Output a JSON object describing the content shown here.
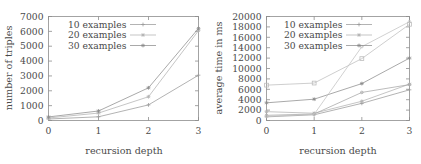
{
  "figure": {
    "panels": [
      "left",
      "right"
    ]
  },
  "left": {
    "ylabel": "number of triples",
    "xlabel": "recursion depth",
    "yticks": [
      "0",
      "1000",
      "2000",
      "3000",
      "4000",
      "5000",
      "6000",
      "7000"
    ],
    "xticks": [
      "0",
      "1",
      "2",
      "3"
    ],
    "legend": [
      "10 examples",
      "20 examples",
      "30 examples"
    ]
  },
  "right": {
    "ylabel": "average time in ms",
    "xlabel": "recursion depth",
    "yticks": [
      "0",
      "2000",
      "4000",
      "6000",
      "8000",
      "10000",
      "12000",
      "14000",
      "16000",
      "18000",
      "20000"
    ],
    "xticks": [
      "0",
      "1",
      "2",
      "3"
    ],
    "legend": [
      "10 examples",
      "20 examples",
      "30 examples"
    ]
  },
  "colors": {
    "series_10": "#9a9a9a",
    "series_20": "#b0b0b0",
    "series_30": "#8a8a8a",
    "axis": "#8d8d8d",
    "text": "#4a4a4a"
  },
  "chart_data": [
    {
      "type": "line",
      "panel": "left",
      "title": "",
      "xlabel": "recursion depth",
      "ylabel": "number of triples",
      "x": [
        0,
        1,
        2,
        3
      ],
      "xlim": [
        0,
        3
      ],
      "ylim": [
        0,
        7000
      ],
      "ytick_values": [
        0,
        1000,
        2000,
        3000,
        4000,
        5000,
        6000,
        7000
      ],
      "xtick_values": [
        0,
        1,
        2,
        3
      ],
      "grid": false,
      "legend": "top-left-inside",
      "series": [
        {
          "name": "10 examples",
          "values": [
            100,
            250,
            1050,
            3050
          ],
          "marker": "plus"
        },
        {
          "name": "20 examples",
          "values": [
            170,
            500,
            1600,
            6050
          ],
          "marker": "cross"
        },
        {
          "name": "30 examples",
          "values": [
            240,
            640,
            2200,
            6200
          ],
          "marker": "star"
        }
      ]
    },
    {
      "type": "line",
      "panel": "right",
      "title": "",
      "xlabel": "recursion depth",
      "ylabel": "average time in ms",
      "x": [
        0,
        1,
        2,
        3
      ],
      "xlim": [
        0,
        3
      ],
      "ylim": [
        0,
        20000
      ],
      "ytick_values": [
        0,
        2000,
        4000,
        6000,
        8000,
        10000,
        12000,
        14000,
        16000,
        18000,
        20000
      ],
      "xtick_values": [
        0,
        1,
        2,
        3
      ],
      "grid": false,
      "legend": "top-left-inside",
      "series": [
        {
          "name": "10 examples",
          "values": [
            700,
            1100,
            3300,
            5900
          ],
          "marker": "plus"
        },
        {
          "name": "20 examples",
          "values": [
            1700,
            1400,
            3700,
            7000
          ],
          "marker": "cross"
        },
        {
          "name": "30 examples",
          "values": [
            3400,
            4100,
            7100,
            12000
          ],
          "marker": "star"
        },
        {
          "name": "10 examples upper",
          "values": [
            6800,
            7200,
            11900,
            18500
          ],
          "marker": "square"
        },
        {
          "name": "20 examples mid",
          "values": [
            1000,
            1250,
            5400,
            6900
          ],
          "marker": "dot"
        },
        {
          "name": "30 examples high",
          "values": [
            800,
            1200,
            14200,
            19000
          ],
          "marker": "dot"
        }
      ]
    }
  ]
}
